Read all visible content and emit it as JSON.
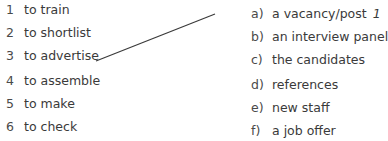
{
  "exercise": {
    "left_items": [
      {
        "number": "1",
        "text": "to train"
      },
      {
        "number": "2",
        "text": "to shortlist"
      },
      {
        "number": "3",
        "text": "to advertise"
      },
      {
        "number": "4",
        "text": "to assemble"
      },
      {
        "number": "5",
        "text": "to make"
      },
      {
        "number": "6",
        "text": "to check"
      }
    ],
    "right_items": [
      {
        "letter": "a)",
        "text": "a vacancy/post",
        "answer": "1"
      },
      {
        "letter": "b)",
        "text": "an interview panel",
        "answer": ""
      },
      {
        "letter": "c)",
        "text": "the candidates",
        "answer": ""
      },
      {
        "letter": "d)",
        "text": "references",
        "answer": ""
      },
      {
        "letter": "e)",
        "text": "new staff",
        "answer": ""
      },
      {
        "letter": "f)",
        "text": "a job offer",
        "answer": ""
      }
    ],
    "example_match": {
      "from": "3",
      "to": "a)"
    },
    "line_color": "#3a3a3a"
  }
}
